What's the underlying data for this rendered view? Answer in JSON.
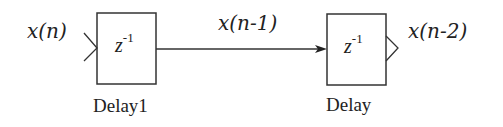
{
  "diagram": {
    "type": "delay-chain block diagram",
    "signals": {
      "input": "x(n)",
      "middle": "x(n-1)",
      "output": "x(n-2)"
    },
    "blocks": [
      {
        "name": "Delay1",
        "operator": "z",
        "exponent": "-1"
      },
      {
        "name": "Delay",
        "operator": "z",
        "exponent": "-1"
      }
    ],
    "colors": {
      "stroke": "#333333",
      "background": "#ffffff"
    }
  }
}
